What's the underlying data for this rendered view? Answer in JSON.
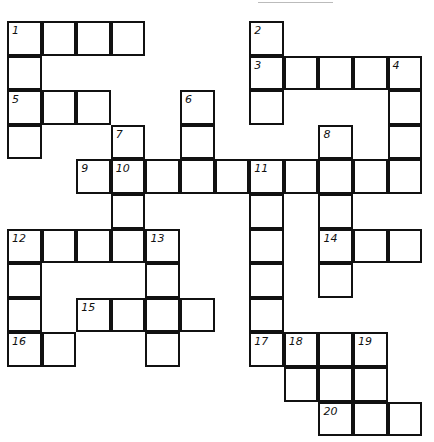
{
  "puzzle": {
    "type": "crossword",
    "cells": [
      {
        "c": 0,
        "r": 0,
        "n": "1"
      },
      {
        "c": 1,
        "r": 0
      },
      {
        "c": 2,
        "r": 0
      },
      {
        "c": 3,
        "r": 0
      },
      {
        "c": 7,
        "r": 0,
        "n": "2"
      },
      {
        "c": 0,
        "r": 1
      },
      {
        "c": 7,
        "r": 1,
        "n": "3"
      },
      {
        "c": 8,
        "r": 1
      },
      {
        "c": 9,
        "r": 1
      },
      {
        "c": 10,
        "r": 1
      },
      {
        "c": 11,
        "r": 1,
        "n": "4"
      },
      {
        "c": 0,
        "r": 2,
        "n": "5"
      },
      {
        "c": 1,
        "r": 2
      },
      {
        "c": 2,
        "r": 2
      },
      {
        "c": 5,
        "r": 2,
        "n": "6"
      },
      {
        "c": 7,
        "r": 2
      },
      {
        "c": 11,
        "r": 2
      },
      {
        "c": 0,
        "r": 3
      },
      {
        "c": 3,
        "r": 3,
        "n": "7"
      },
      {
        "c": 5,
        "r": 3
      },
      {
        "c": 9,
        "r": 3,
        "n": "8"
      },
      {
        "c": 11,
        "r": 3
      },
      {
        "c": 2,
        "r": 4,
        "n": "9"
      },
      {
        "c": 3,
        "r": 4,
        "n": "10"
      },
      {
        "c": 4,
        "r": 4
      },
      {
        "c": 5,
        "r": 4
      },
      {
        "c": 6,
        "r": 4
      },
      {
        "c": 7,
        "r": 4,
        "n": "11"
      },
      {
        "c": 8,
        "r": 4
      },
      {
        "c": 9,
        "r": 4
      },
      {
        "c": 10,
        "r": 4
      },
      {
        "c": 11,
        "r": 4
      },
      {
        "c": 3,
        "r": 5
      },
      {
        "c": 7,
        "r": 5
      },
      {
        "c": 9,
        "r": 5
      },
      {
        "c": 0,
        "r": 6,
        "n": "12"
      },
      {
        "c": 1,
        "r": 6
      },
      {
        "c": 2,
        "r": 6
      },
      {
        "c": 3,
        "r": 6
      },
      {
        "c": 4,
        "r": 6,
        "n": "13"
      },
      {
        "c": 7,
        "r": 6
      },
      {
        "c": 9,
        "r": 6,
        "n": "14"
      },
      {
        "c": 10,
        "r": 6
      },
      {
        "c": 11,
        "r": 6
      },
      {
        "c": 0,
        "r": 7
      },
      {
        "c": 4,
        "r": 7
      },
      {
        "c": 7,
        "r": 7
      },
      {
        "c": 9,
        "r": 7
      },
      {
        "c": 0,
        "r": 8
      },
      {
        "c": 2,
        "r": 8,
        "n": "15"
      },
      {
        "c": 3,
        "r": 8
      },
      {
        "c": 4,
        "r": 8
      },
      {
        "c": 5,
        "r": 8
      },
      {
        "c": 7,
        "r": 8
      },
      {
        "c": 0,
        "r": 9,
        "n": "16"
      },
      {
        "c": 1,
        "r": 9
      },
      {
        "c": 4,
        "r": 9
      },
      {
        "c": 7,
        "r": 9,
        "n": "17"
      },
      {
        "c": 8,
        "r": 9,
        "n": "18"
      },
      {
        "c": 9,
        "r": 9
      },
      {
        "c": 10,
        "r": 9,
        "n": "19"
      },
      {
        "c": 8,
        "r": 10
      },
      {
        "c": 9,
        "r": 10
      },
      {
        "c": 10,
        "r": 10
      },
      {
        "c": 9,
        "r": 11,
        "n": "20"
      },
      {
        "c": 10,
        "r": 11
      },
      {
        "c": 11,
        "r": 11
      }
    ],
    "clue_numbers": [
      "1",
      "2",
      "3",
      "4",
      "5",
      "6",
      "7",
      "8",
      "9",
      "10",
      "11",
      "12",
      "13",
      "14",
      "15",
      "16",
      "17",
      "18",
      "19",
      "20"
    ]
  }
}
